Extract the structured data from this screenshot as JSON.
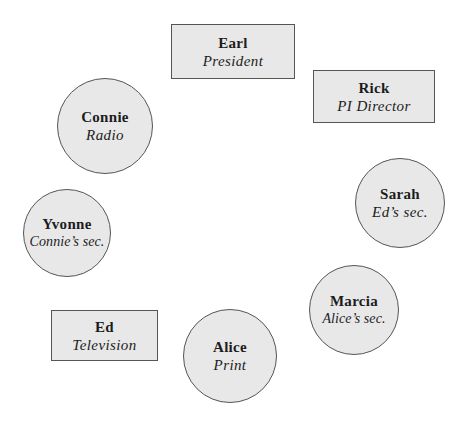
{
  "diagram": {
    "type": "organization-seating",
    "fill_color": "#e8e8e8",
    "stroke_color": "#555555",
    "nodes": [
      {
        "id": "earl",
        "shape": "rectangle",
        "name": "Earl",
        "role": "President",
        "x": 171,
        "y": 24,
        "w": 124,
        "h": 55
      },
      {
        "id": "rick",
        "shape": "rectangle",
        "name": "Rick",
        "role": "PI Director",
        "x": 313,
        "y": 70,
        "w": 122,
        "h": 53
      },
      {
        "id": "connie",
        "shape": "circle",
        "name": "Connie",
        "role": "Radio",
        "cx": 105,
        "cy": 126,
        "r": 48
      },
      {
        "id": "sarah",
        "shape": "circle",
        "name": "Sarah",
        "role": "Ed’s sec.",
        "cx": 400,
        "cy": 203,
        "r": 45
      },
      {
        "id": "yvonne",
        "shape": "circle",
        "name": "Yvonne",
        "role": "Connie’s sec.",
        "cx": 67,
        "cy": 233,
        "r": 44
      },
      {
        "id": "marcia",
        "shape": "circle",
        "name": "Marcia",
        "role": "Alice’s sec.",
        "cx": 354,
        "cy": 310,
        "r": 45
      },
      {
        "id": "ed",
        "shape": "rectangle",
        "name": "Ed",
        "role": "Television",
        "x": 51,
        "y": 310,
        "w": 107,
        "h": 51
      },
      {
        "id": "alice",
        "shape": "circle",
        "name": "Alice",
        "role": "Print",
        "cx": 230,
        "cy": 356,
        "r": 47
      }
    ]
  }
}
